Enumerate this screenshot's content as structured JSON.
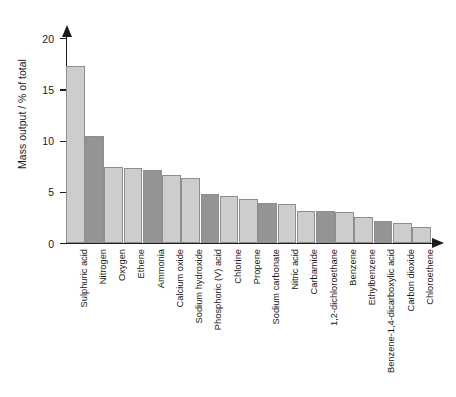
{
  "chart_data": {
    "type": "bar",
    "title": "",
    "xlabel": "",
    "ylabel": "Mass output / % of total",
    "ylim": [
      0,
      20
    ],
    "yticks": [
      0,
      5,
      10,
      15,
      20
    ],
    "ytick_labels": [
      "0",
      "5",
      "10",
      "15",
      "20"
    ],
    "grid": false,
    "legend": "none",
    "categories": [
      "Sulphuric acid",
      "Nitrogen",
      "Oxygen",
      "Ethene",
      "Ammonia",
      "Calcium oxide",
      "Sodium hydroxide",
      "Phosphoric (V) acid",
      "Chlorine",
      "Propene",
      "Sodium carbonate",
      "Nitric acid",
      "Carbamide",
      "1,2-dichloroethane",
      "Benzene",
      "Ethylbenzene",
      "Benzene-1,4-dicarboxylic acid",
      "Carbon dioxide",
      "Chloroethene"
    ],
    "values": [
      17.3,
      10.4,
      7.4,
      7.3,
      7.1,
      6.6,
      6.3,
      4.8,
      4.6,
      4.3,
      3.9,
      3.8,
      3.1,
      3.1,
      3.0,
      2.5,
      2.1,
      2.0,
      1.6
    ],
    "bar_shades": [
      "light",
      "dark",
      "light",
      "light",
      "dark",
      "light",
      "light",
      "dark",
      "light",
      "light",
      "dark",
      "light",
      "light",
      "dark",
      "light",
      "light",
      "dark",
      "light",
      "light"
    ],
    "colors": {
      "bar_light": "#cdcdcb",
      "bar_dark": "#949494",
      "bar_border": "#8e8e8e",
      "axis": "#1b1b1b",
      "text": "#171717",
      "background": "#ffffff"
    }
  }
}
